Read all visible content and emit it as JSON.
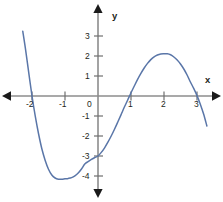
{
  "figure": {
    "width": 223,
    "height": 202,
    "background": "#ffffff"
  },
  "axes": {
    "x_axis_label": "x",
    "y_axis_label": "y",
    "axis_color": "#8c8c8c",
    "arrow_color": "#1a1a1a",
    "label_color": "#231f20",
    "origin_label": "0",
    "x_tick_labels": [
      "-2",
      "-1",
      "1",
      "2",
      "3"
    ],
    "y_tick_labels": [
      "3",
      "2",
      "1",
      "-1",
      "-2",
      "-3",
      "-4"
    ]
  },
  "chart_data": {
    "type": "line",
    "title": "",
    "xlabel": "x",
    "ylabel": "y",
    "grid": false,
    "legend": "none",
    "xlim": [
      -2.35,
      3.4
    ],
    "ylim": [
      -4.6,
      3.4
    ],
    "xticks": [
      -2,
      -1,
      0,
      1,
      2,
      3
    ],
    "yticks": [
      3,
      2,
      1,
      0,
      -1,
      -2,
      -3,
      -4
    ],
    "series": [
      {
        "name": "cubic curve",
        "color": "#5a76a8",
        "x_intercepts": [
          -2.0,
          0.95,
          3.05
        ],
        "y_intercept": -3.0,
        "local_minimum": [
          -0.8,
          -4.1
        ],
        "local_maximum": [
          2.1,
          2.1
        ],
        "x": [
          -2.28,
          -2.2,
          -2.1,
          -2.0,
          -1.9,
          -1.8,
          -1.7,
          -1.6,
          -1.5,
          -1.4,
          -1.3,
          -1.2,
          -1.1,
          -1.0,
          -0.9,
          -0.8,
          -0.7,
          -0.6,
          -0.5,
          -0.4,
          -0.3,
          -0.2,
          -0.1,
          0.0,
          0.1,
          0.2,
          0.3,
          0.4,
          0.5,
          0.6,
          0.7,
          0.8,
          0.9,
          1.0,
          1.1,
          1.2,
          1.3,
          1.4,
          1.5,
          1.6,
          1.7,
          1.8,
          1.9,
          2.0,
          2.1,
          2.2,
          2.3,
          2.4,
          2.5,
          2.6,
          2.7,
          2.8,
          2.9,
          3.0,
          3.1,
          3.2,
          3.3
        ],
        "y": [
          3.24,
          2.38,
          1.18,
          0.0,
          -1.02,
          -1.9,
          -2.65,
          -3.22,
          -3.66,
          -3.95,
          -4.1,
          -4.16,
          -4.16,
          -4.14,
          -4.12,
          -4.08,
          -3.99,
          -3.85,
          -3.65,
          -3.4,
          -3.28,
          -3.17,
          -3.08,
          -3.0,
          -2.82,
          -2.59,
          -2.31,
          -2.0,
          -1.66,
          -1.3,
          -0.93,
          -0.55,
          -0.2,
          0.16,
          0.5,
          0.83,
          1.13,
          1.4,
          1.63,
          1.82,
          1.96,
          2.05,
          2.1,
          2.11,
          2.11,
          2.06,
          1.95,
          1.8,
          1.6,
          1.35,
          1.05,
          0.7,
          0.38,
          0.02,
          -0.41,
          -0.9,
          -1.5
        ]
      }
    ]
  }
}
